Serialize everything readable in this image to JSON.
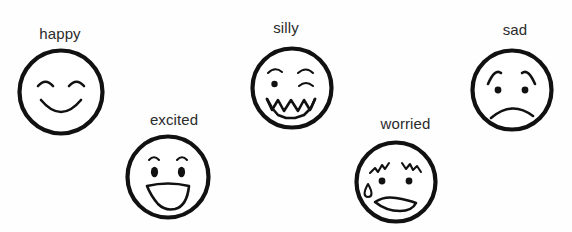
{
  "canvas": {
    "width": 572,
    "height": 232,
    "background": "#fefefe",
    "ink": "#111111",
    "text_color": "#2b2b2b"
  },
  "faces": [
    {
      "id": "happy",
      "label": "happy",
      "label_x": 35,
      "label_y": 25,
      "label_width": 50,
      "circle_cx": 61,
      "circle_cy": 92,
      "circle_r": 42,
      "eyes": "closed-smiling-arcs",
      "mouth": "wide-smile-curve"
    },
    {
      "id": "excited",
      "label": "excited",
      "label_x": 141,
      "label_y": 111,
      "label_width": 66,
      "circle_cx": 167,
      "circle_cy": 176,
      "circle_r": 41,
      "eyes": "oval-eyes-with-brow-arcs",
      "mouth": "big-open-grin"
    },
    {
      "id": "silly",
      "label": "silly",
      "label_x": 268,
      "label_y": 19,
      "label_width": 36,
      "circle_cx": 291,
      "circle_cy": 87,
      "circle_r": 40,
      "eyes": "one-dot-one-wink-with-brows",
      "mouth": "zigzag-wavy"
    },
    {
      "id": "worried",
      "label": "worried",
      "label_x": 373,
      "label_y": 115,
      "label_width": 65,
      "circle_cx": 395,
      "circle_cy": 181,
      "circle_r": 41,
      "eyes": "dot-eyes-with-squiggle-brows",
      "mouth": "wavy-open-frown",
      "extra": "sweat-drop"
    },
    {
      "id": "sad",
      "label": "sad",
      "label_x": 500,
      "label_y": 21,
      "label_width": 30,
      "circle_cx": 511,
      "circle_cy": 89,
      "circle_r": 41,
      "eyes": "dot-eyes-with-sad-slanted-brows",
      "mouth": "frown-curve"
    }
  ]
}
